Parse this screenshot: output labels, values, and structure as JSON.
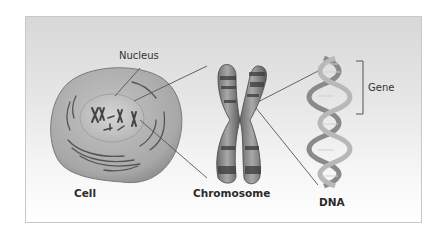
{
  "diagram": {
    "title": "",
    "labels": {
      "nucleus": "Nucleus",
      "cell": "Cell",
      "chromosome": "Chromosome",
      "dna": "DNA",
      "gene": "Gene"
    },
    "colors": {
      "frame_border": "#c8c8c8",
      "background_top": "#d8d8d8",
      "background_bottom": "#ffffff",
      "cell_fill": "#a9a9a9",
      "nucleus_fill": "#bdbdbd",
      "chromosome_fill": "#8a8a8a",
      "leader_line": "#555555"
    },
    "hierarchy": [
      "Cell",
      "Nucleus",
      "Chromosome",
      "DNA",
      "Gene"
    ]
  }
}
